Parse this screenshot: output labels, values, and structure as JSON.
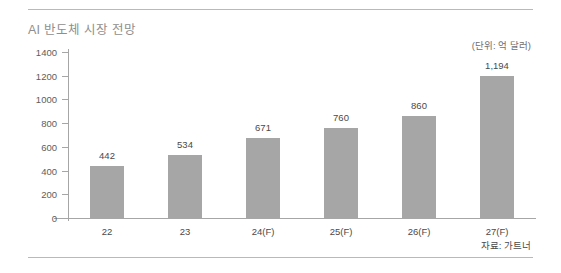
{
  "chart_data": {
    "type": "bar",
    "title": "AI 반도체 시장 전망",
    "unit_note": "(단위: 억 달러)",
    "source_note": "자료: 가트너",
    "xlabel": "",
    "ylabel": "",
    "categories": [
      "22",
      "23",
      "24(F)",
      "25(F)",
      "26(F)",
      "27(F)"
    ],
    "values": [
      442,
      534,
      671,
      760,
      860,
      1194
    ],
    "value_labels": [
      "442",
      "534",
      "671",
      "760",
      "860",
      "1,194"
    ],
    "ylim": [
      0,
      1400
    ],
    "yticks": [
      0,
      200,
      400,
      600,
      800,
      1000,
      1200,
      1400
    ],
    "ytick_labels": [
      "0",
      "200",
      "400",
      "600",
      "800",
      "1000",
      "1200",
      "1400"
    ],
    "grid": false,
    "legend": null,
    "bar_color": "#a6a6a6",
    "axis_color": "#a6a6a6",
    "title_color": "#8e8e8e",
    "label_color": "#4a4a4a"
  }
}
